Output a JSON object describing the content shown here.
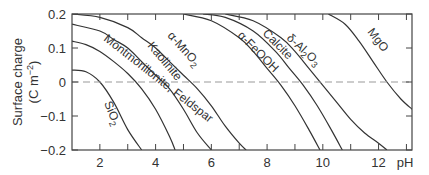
{
  "chart_data": {
    "type": "line",
    "title": "",
    "xlabel": "pH",
    "ylabel": "Surface charge (C m^-2)",
    "ylabel_line1": "Surface charge",
    "ylabel_line2": "(C m",
    "ylabel_exp": "−2",
    "ylabel_close": ")",
    "xlim": [
      1,
      13.2
    ],
    "ylim": [
      -0.2,
      0.2
    ],
    "x_ticks": [
      2,
      3,
      4,
      5,
      6,
      7,
      8,
      9,
      10,
      11,
      12,
      13
    ],
    "x_tick_labels": [
      "2",
      "4",
      "6",
      "8",
      "10",
      "12"
    ],
    "x_tick_label_values": [
      2,
      4,
      6,
      8,
      10,
      12
    ],
    "y_ticks": [
      0.2,
      0.1,
      0,
      -0.1,
      -0.2
    ],
    "y_tick_labels": [
      "0.2",
      "0.1",
      "0",
      "−0.1",
      "−0.2"
    ],
    "zero_line": "dashed",
    "grid": false,
    "legend": "inline labels on curves",
    "series": [
      {
        "name": "SiO2",
        "label": "SiO",
        "sub": "2",
        "points": [
          [
            1.0,
            0.035
          ],
          [
            1.5,
            0.03
          ],
          [
            2.0,
            0.0
          ],
          [
            2.5,
            -0.06
          ],
          [
            3.0,
            -0.14
          ],
          [
            3.5,
            -0.2
          ]
        ]
      },
      {
        "name": "Montmorillonite, Feldspar",
        "label": "Montmorillonite, Feldspar",
        "sub": "",
        "points": [
          [
            1.0,
            0.12
          ],
          [
            1.5,
            0.11
          ],
          [
            2.0,
            0.09
          ],
          [
            2.5,
            0.06
          ],
          [
            3.0,
            0.025
          ],
          [
            3.5,
            -0.02
          ],
          [
            4.0,
            -0.08
          ],
          [
            4.5,
            -0.16
          ],
          [
            4.7,
            -0.2
          ]
        ]
      },
      {
        "name": "Kaolinite",
        "label": "Kaolinite",
        "sub": "",
        "points": [
          [
            1.0,
            0.17
          ],
          [
            2.0,
            0.15
          ],
          [
            2.5,
            0.125
          ],
          [
            3.0,
            0.1
          ],
          [
            3.5,
            0.06
          ],
          [
            4.0,
            0.02
          ],
          [
            4.5,
            -0.02
          ],
          [
            5.0,
            -0.08
          ],
          [
            5.5,
            -0.15
          ],
          [
            6.0,
            -0.2
          ]
        ]
      },
      {
        "name": "α-MnO2",
        "label": "α-MnO",
        "sub": "2",
        "points": [
          [
            1.0,
            0.2
          ],
          [
            2.0,
            0.19
          ],
          [
            3.0,
            0.16
          ],
          [
            3.5,
            0.13
          ],
          [
            4.0,
            0.1
          ],
          [
            4.5,
            0.06
          ],
          [
            5.0,
            0.02
          ],
          [
            5.5,
            -0.02
          ],
          [
            6.0,
            -0.07
          ],
          [
            6.5,
            -0.13
          ],
          [
            7.0,
            -0.18
          ],
          [
            7.25,
            -0.2
          ]
        ]
      },
      {
        "name": "α-FeOOH",
        "label": "α-FeOOH",
        "sub": "",
        "points": [
          [
            5.0,
            0.2
          ],
          [
            6.0,
            0.18
          ],
          [
            7.0,
            0.13
          ],
          [
            7.5,
            0.09
          ],
          [
            8.0,
            0.04
          ],
          [
            8.5,
            -0.01
          ],
          [
            9.0,
            -0.07
          ],
          [
            9.5,
            -0.14
          ],
          [
            9.9,
            -0.2
          ]
        ]
      },
      {
        "name": "Calcite",
        "label": "Calcite",
        "sub": "",
        "points": [
          [
            5.7,
            0.2
          ],
          [
            6.5,
            0.19
          ],
          [
            7.5,
            0.15
          ],
          [
            8.3,
            0.09
          ],
          [
            8.8,
            0.04
          ],
          [
            9.3,
            -0.01
          ],
          [
            9.8,
            -0.07
          ],
          [
            10.3,
            -0.14
          ],
          [
            10.7,
            -0.2
          ]
        ]
      },
      {
        "name": "δ-Al2O3",
        "label": "δ-Al",
        "sub": "2",
        "label_tail": "O",
        "sub2": "3",
        "points": [
          [
            6.5,
            0.2
          ],
          [
            7.5,
            0.18
          ],
          [
            8.5,
            0.13
          ],
          [
            9.0,
            0.09
          ],
          [
            9.5,
            0.04
          ],
          [
            10.0,
            -0.01
          ],
          [
            10.5,
            -0.06
          ],
          [
            11.0,
            -0.11
          ],
          [
            11.5,
            -0.15
          ],
          [
            12.0,
            -0.18
          ],
          [
            12.3,
            -0.2
          ]
        ]
      },
      {
        "name": "MgO",
        "label": "MgO",
        "sub": "",
        "points": [
          [
            10.2,
            0.2
          ],
          [
            10.8,
            0.17
          ],
          [
            11.3,
            0.12
          ],
          [
            11.8,
            0.06
          ],
          [
            12.3,
            0.0
          ],
          [
            12.8,
            -0.05
          ],
          [
            13.2,
            -0.08
          ]
        ]
      }
    ]
  }
}
